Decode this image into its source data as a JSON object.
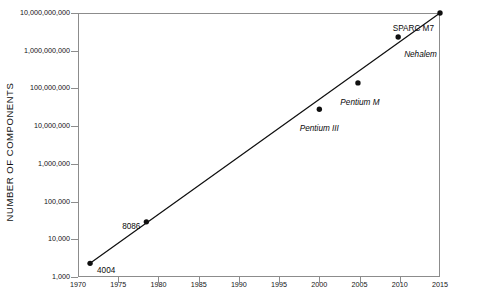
{
  "chart_data": {
    "type": "scatter",
    "title": "",
    "subtitle": "",
    "xlabel": "",
    "ylabel": "NUMBER OF COMPONENTS",
    "xlim": [
      1970,
      2015
    ],
    "ylim": [
      1000,
      10000000000
    ],
    "yscale": "log",
    "xscale": "linear",
    "grid": false,
    "legend": false,
    "legend_position": "none",
    "x_ticks": [
      1970,
      1975,
      1980,
      1985,
      1990,
      1995,
      2000,
      2005,
      2010,
      2015
    ],
    "x_tick_labels": [
      "1970",
      "1975",
      "1980",
      "1985",
      "1990",
      "1995",
      "2000",
      "2005",
      "2010",
      "2015"
    ],
    "y_ticks": [
      1000,
      10000,
      100000,
      1000000,
      10000000,
      100000000,
      1000000000,
      10000000000
    ],
    "y_tick_labels": [
      "1,000",
      "10,000",
      "100,000",
      "1,000,000",
      "10,000,000",
      "100,000,000",
      "1,000,000,000",
      "10,000,000,000"
    ],
    "points": [
      {
        "label": "4004",
        "x": 1971.5,
        "y": 2300,
        "italic": false,
        "label_anchor": "start",
        "label_dx": 7,
        "label_dy": 4
      },
      {
        "label": "8086",
        "x": 1978.5,
        "y": 29000,
        "italic": false,
        "label_anchor": "end",
        "label_dx": -6,
        "label_dy": 1
      },
      {
        "label": "Pentium III",
        "x": 2000.0,
        "y": 28000000,
        "italic": true,
        "label_anchor": "mid",
        "label_dx": 0,
        "label_dy": 16
      },
      {
        "label": "Pentium M",
        "x": 2004.8,
        "y": 140000000,
        "italic": true,
        "label_anchor": "mid",
        "label_dx": 2,
        "label_dy": 16
      },
      {
        "label": "Nehalem",
        "x": 2009.8,
        "y": 2300000000,
        "italic": true,
        "label_anchor": "start",
        "label_dx": 6,
        "label_dy": 14
      },
      {
        "label": "SPARC M7",
        "x": 2015.0,
        "y": 10000000000,
        "italic": false,
        "label_anchor": "end",
        "label_dx": -6,
        "label_dy": 12
      }
    ],
    "trend_line": {
      "name": "Moore's Law trend",
      "x_start": 1971.5,
      "y_start": 2300,
      "x_end": 2015.0,
      "y_end": 10000000000
    },
    "colors": {
      "marker": "#101010",
      "line": "#101010",
      "axis": "#8c8c8c",
      "text": "#101010",
      "background": "#ffffff"
    }
  }
}
